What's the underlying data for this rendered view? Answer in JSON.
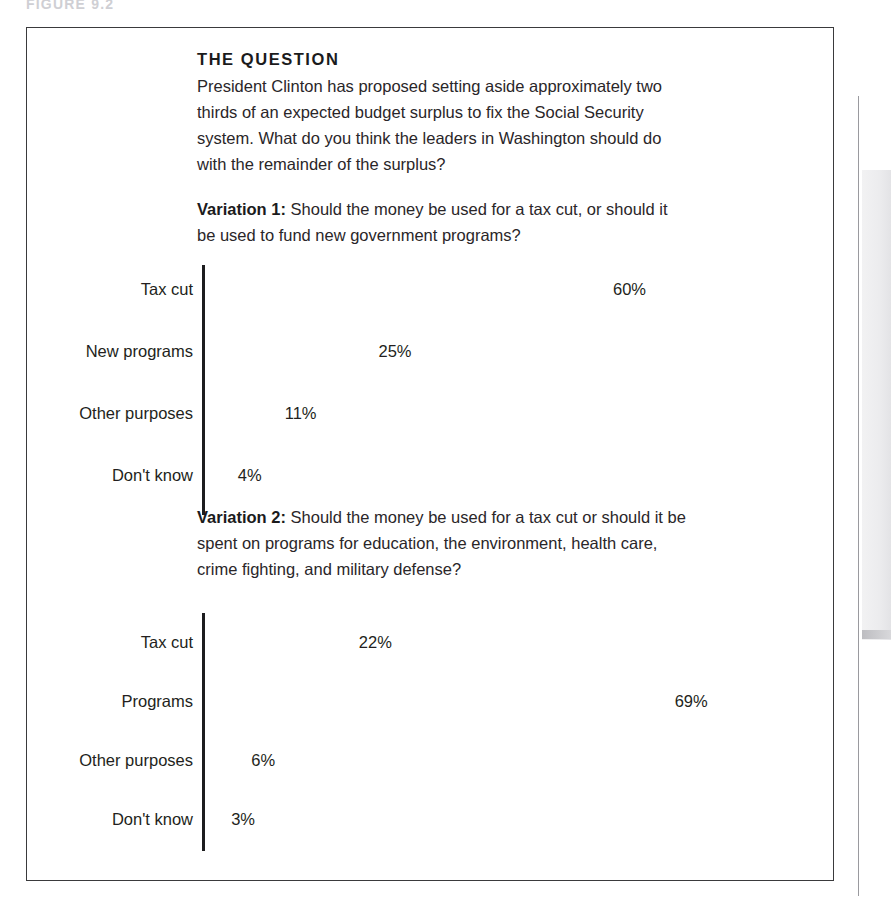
{
  "figure": {
    "top_caption": "FIGURE 9.2",
    "heading": "THE QUESTION",
    "question_text": "President Clinton has proposed setting aside approximately two thirds of an expected budget surplus to fix the Social Security system. What do you think the leaders in Washington should do with the remainder of the surplus?"
  },
  "variations": [
    {
      "label": "Variation 1:",
      "text": " Should the money be used for a tax cut, or should it be used to fund new government programs?"
    },
    {
      "label": "Variation 2:",
      "text": " Should the money be used for a tax cut or should it be spent on programs for education, the environment, health care, crime fighting, and military defense?"
    }
  ],
  "colors": {
    "bar_chart_1": "#474749",
    "bar_chart_2": "#7d7d80",
    "axis": "#1d1d1f",
    "text": "#231f20",
    "frame": "#3a3a3c"
  },
  "chart_data": [
    {
      "type": "bar",
      "orientation": "horizontal",
      "title": "Variation 1: Should the money be used for a tax cut, or should it be used to fund new government programs?",
      "xlabel": "",
      "ylabel": "",
      "xlim": [
        0,
        100
      ],
      "grid": false,
      "legend": "none",
      "bar_color": "#474749",
      "categories": [
        "Tax cut",
        "New programs",
        "Other purposes",
        "Don't know"
      ],
      "values": [
        60,
        25,
        11,
        4
      ],
      "value_labels": [
        "60%",
        "25%",
        "11%",
        "4%"
      ]
    },
    {
      "type": "bar",
      "orientation": "horizontal",
      "title": "Variation 2: Should the money be used for a tax cut or should it be spent on programs for education, the environment, health care, crime fighting, and military defense?",
      "xlabel": "",
      "ylabel": "",
      "xlim": [
        0,
        100
      ],
      "grid": false,
      "legend": "none",
      "bar_color": "#7d7d80",
      "categories": [
        "Tax cut",
        "Programs",
        "Other purposes",
        "Don't know"
      ],
      "values": [
        22,
        69,
        6,
        3
      ],
      "value_labels": [
        "22%",
        "69%",
        "6%",
        "3%"
      ]
    }
  ]
}
